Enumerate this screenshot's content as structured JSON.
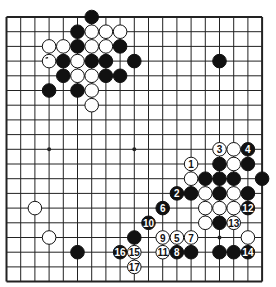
{
  "board": {
    "size": 19,
    "origin_x": 6.5,
    "origin_y": 17,
    "cell_w": 14.2,
    "cell_h": 14.7,
    "stone_r": 6.8,
    "line_color": "#222222",
    "black_color": "#111111",
    "white_color": "#ffffff",
    "star_points": [
      [
        3,
        9
      ],
      [
        9,
        9
      ],
      [
        15,
        15
      ]
    ]
  },
  "stones": [
    {
      "c": 6,
      "r": 0,
      "color": "black"
    },
    {
      "c": 5,
      "r": 1,
      "color": "black"
    },
    {
      "c": 6,
      "r": 1,
      "color": "white"
    },
    {
      "c": 7,
      "r": 1,
      "color": "white"
    },
    {
      "c": 8,
      "r": 1,
      "color": "white"
    },
    {
      "c": 3,
      "r": 2,
      "color": "white"
    },
    {
      "c": 4,
      "r": 2,
      "color": "white"
    },
    {
      "c": 5,
      "r": 2,
      "color": "black"
    },
    {
      "c": 6,
      "r": 2,
      "color": "white"
    },
    {
      "c": 7,
      "r": 2,
      "color": "white"
    },
    {
      "c": 8,
      "r": 2,
      "color": "black"
    },
    {
      "c": 3,
      "r": 3,
      "color": "white",
      "mark": true
    },
    {
      "c": 4,
      "r": 3,
      "color": "black"
    },
    {
      "c": 5,
      "r": 3,
      "color": "white"
    },
    {
      "c": 6,
      "r": 3,
      "color": "black"
    },
    {
      "c": 7,
      "r": 3,
      "color": "black"
    },
    {
      "c": 9,
      "r": 3,
      "color": "black"
    },
    {
      "c": 15,
      "r": 3,
      "color": "black"
    },
    {
      "c": 4,
      "r": 4,
      "color": "black"
    },
    {
      "c": 5,
      "r": 4,
      "color": "white"
    },
    {
      "c": 6,
      "r": 4,
      "color": "white"
    },
    {
      "c": 7,
      "r": 4,
      "color": "black"
    },
    {
      "c": 8,
      "r": 4,
      "color": "black"
    },
    {
      "c": 3,
      "r": 5,
      "color": "black"
    },
    {
      "c": 5,
      "r": 5,
      "color": "black"
    },
    {
      "c": 6,
      "r": 5,
      "color": "white"
    },
    {
      "c": 6,
      "r": 6,
      "color": "white"
    },
    {
      "c": 15,
      "r": 9,
      "color": "white",
      "label": "3"
    },
    {
      "c": 16,
      "r": 9,
      "color": "white"
    },
    {
      "c": 17,
      "r": 9,
      "color": "black",
      "label": "4"
    },
    {
      "c": 13,
      "r": 10,
      "color": "white",
      "label": "1"
    },
    {
      "c": 15,
      "r": 10,
      "color": "black"
    },
    {
      "c": 16,
      "r": 10,
      "color": "white"
    },
    {
      "c": 17,
      "r": 10,
      "color": "black"
    },
    {
      "c": 13,
      "r": 11,
      "color": "white"
    },
    {
      "c": 14,
      "r": 11,
      "color": "black"
    },
    {
      "c": 15,
      "r": 11,
      "color": "black"
    },
    {
      "c": 16,
      "r": 11,
      "color": "black"
    },
    {
      "c": 18,
      "r": 11,
      "color": "black"
    },
    {
      "c": 12,
      "r": 12,
      "color": "black",
      "label": "2"
    },
    {
      "c": 13,
      "r": 12,
      "color": "black"
    },
    {
      "c": 14,
      "r": 12,
      "color": "white"
    },
    {
      "c": 15,
      "r": 12,
      "color": "black"
    },
    {
      "c": 16,
      "r": 12,
      "color": "white"
    },
    {
      "c": 17,
      "r": 12,
      "color": "black"
    },
    {
      "c": 2,
      "r": 13,
      "color": "white"
    },
    {
      "c": 11,
      "r": 13,
      "color": "black",
      "label": "6"
    },
    {
      "c": 14,
      "r": 13,
      "color": "white"
    },
    {
      "c": 15,
      "r": 13,
      "color": "white"
    },
    {
      "c": 16,
      "r": 13,
      "color": "white"
    },
    {
      "c": 17,
      "r": 13,
      "color": "black",
      "label": "12"
    },
    {
      "c": 10,
      "r": 14,
      "color": "black",
      "label": "10"
    },
    {
      "c": 14,
      "r": 14,
      "color": "white"
    },
    {
      "c": 15,
      "r": 14,
      "color": "black"
    },
    {
      "c": 16,
      "r": 14,
      "color": "white",
      "label": "13"
    },
    {
      "c": 3,
      "r": 15,
      "color": "white"
    },
    {
      "c": 9,
      "r": 15,
      "color": "black"
    },
    {
      "c": 11,
      "r": 15,
      "color": "white",
      "label": "9"
    },
    {
      "c": 12,
      "r": 15,
      "color": "white",
      "label": "5"
    },
    {
      "c": 13,
      "r": 15,
      "color": "white",
      "label": "7"
    },
    {
      "c": 17,
      "r": 15,
      "color": "white"
    },
    {
      "c": 5,
      "r": 16,
      "color": "black"
    },
    {
      "c": 8,
      "r": 16,
      "color": "black",
      "label": "16"
    },
    {
      "c": 9,
      "r": 16,
      "color": "white",
      "label": "15"
    },
    {
      "c": 11,
      "r": 16,
      "color": "white",
      "label": "11"
    },
    {
      "c": 12,
      "r": 16,
      "color": "black",
      "label": "8"
    },
    {
      "c": 13,
      "r": 16,
      "color": "black"
    },
    {
      "c": 15,
      "r": 16,
      "color": "black"
    },
    {
      "c": 16,
      "r": 16,
      "color": "black"
    },
    {
      "c": 17,
      "r": 16,
      "color": "black",
      "label": "14"
    },
    {
      "c": 9,
      "r": 17,
      "color": "white",
      "label": "17"
    }
  ]
}
